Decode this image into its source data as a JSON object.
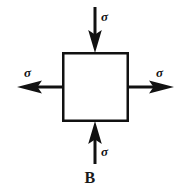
{
  "figure": {
    "caption": "B",
    "background_color": "#ffffff",
    "stroke_color": "#111111",
    "element": {
      "name": "stress-element-square",
      "x": 63,
      "y": 53,
      "width": 65,
      "height": 68,
      "stroke_width": 2.5,
      "fill": "#ffffff"
    },
    "arrows": [
      {
        "id": "top-arrow",
        "direction": "down",
        "sense": "compression",
        "label": "σ",
        "from": {
          "x": 95,
          "y": 7
        },
        "to": {
          "x": 95,
          "y": 52
        }
      },
      {
        "id": "left-arrow",
        "direction": "left",
        "sense": "tension",
        "label": "σ",
        "from": {
          "x": 63,
          "y": 87
        },
        "to": {
          "x": 17,
          "y": 87
        }
      },
      {
        "id": "right-arrow",
        "direction": "right",
        "sense": "tension",
        "label": "σ",
        "from": {
          "x": 128,
          "y": 87
        },
        "to": {
          "x": 173,
          "y": 87
        }
      },
      {
        "id": "bottom-arrow",
        "direction": "up",
        "sense": "compression",
        "label": "σ",
        "from": {
          "x": 95,
          "y": 164
        },
        "to": {
          "x": 95,
          "y": 122
        }
      }
    ],
    "labels": {
      "top": "σ",
      "left": "σ",
      "right": "σ",
      "bottom": "σ"
    }
  }
}
